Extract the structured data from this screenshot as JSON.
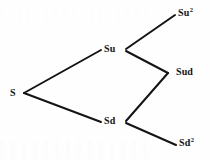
{
  "figure": {
    "kind": "binomial-tree",
    "background_color": "#fefefe",
    "line_color": "#141414",
    "text_color": "#141414",
    "line_width": 2
  },
  "chart_data": {
    "type": "diagram",
    "title": "",
    "nodes": [
      {
        "id": "S",
        "label_text": "S",
        "base": "S",
        "exponent": "",
        "x": 24,
        "y": 93,
        "label_x": 10,
        "label_y": 88
      },
      {
        "id": "Su",
        "label_text": "Su",
        "base": "Su",
        "exponent": "",
        "x": 124,
        "y": 50,
        "label_x": 104,
        "label_y": 44
      },
      {
        "id": "Sd",
        "label_text": "Sd",
        "base": "Sd",
        "exponent": "",
        "x": 124,
        "y": 122,
        "label_x": 104,
        "label_y": 116
      },
      {
        "id": "Su2",
        "label_text": "Su2",
        "base": "Su",
        "exponent": "2",
        "x": 175,
        "y": 15,
        "label_x": 178,
        "label_y": 8
      },
      {
        "id": "Sud",
        "label_text": "Sud",
        "base": "Sud",
        "exponent": "",
        "x": 168,
        "y": 73,
        "label_x": 176,
        "label_y": 67
      },
      {
        "id": "Sd2",
        "label_text": "Sd2",
        "base": "Sd",
        "exponent": "2",
        "x": 176,
        "y": 145,
        "label_x": 179,
        "label_y": 138
      }
    ],
    "edges": [
      {
        "from": "S",
        "to": "Su",
        "x1": 24,
        "y1": 93,
        "x2": 101,
        "y2": 50
      },
      {
        "from": "S",
        "to": "Sd",
        "x1": 24,
        "y1": 93,
        "x2": 101,
        "y2": 122
      },
      {
        "from": "Su",
        "to": "Su2",
        "x1": 126,
        "y1": 49,
        "x2": 175,
        "y2": 15
      },
      {
        "from": "Su",
        "to": "Sud",
        "x1": 126,
        "y1": 51,
        "x2": 168,
        "y2": 73
      },
      {
        "from": "Sd",
        "to": "Sud",
        "x1": 126,
        "y1": 121,
        "x2": 168,
        "y2": 73
      },
      {
        "from": "Sd",
        "to": "Sd2",
        "x1": 126,
        "y1": 123,
        "x2": 176,
        "y2": 145
      }
    ]
  }
}
